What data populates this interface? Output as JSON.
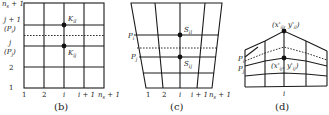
{
  "figure": {
    "panels": [
      {
        "id": "b",
        "caption": "(b)",
        "type": "rectangular-grid",
        "row_labels": [
          "n_s + 1",
          "j + 1",
          "(P_i)",
          "j",
          "(P_j)",
          "2",
          "1"
        ],
        "col_labels": [
          "1",
          "2",
          "i",
          "i + 1",
          "n_s + 1"
        ],
        "points": [
          {
            "label": "K_il",
            "position": "upper"
          },
          {
            "label": "K_ij",
            "position": "lower"
          }
        ]
      },
      {
        "id": "c",
        "caption": "(c)",
        "type": "trapezoidal-grid",
        "row_labels": [
          "P_i",
          "P_j"
        ],
        "col_labels": [
          "1",
          "2",
          "i",
          "i + 1",
          "n_s + 1"
        ],
        "points": [
          {
            "label": "S_il",
            "position": "upper"
          },
          {
            "label": "S_ij",
            "position": "lower"
          }
        ]
      },
      {
        "id": "d",
        "caption": "(d)",
        "type": "deformed-grid",
        "row_labels": [
          "P_i",
          "P_j"
        ],
        "col_labels": [
          "i"
        ],
        "points": [
          {
            "label": "(x'_il, y'_il)",
            "position": "upper"
          },
          {
            "label": "(x'_ij, y'_ij)",
            "position": "lower"
          }
        ]
      }
    ]
  },
  "text": {
    "b_ns1_top": "n",
    "b_ns1_top_sub": "s",
    "b_ns1_top_rest": " + 1",
    "b_j1": "j + 1",
    "b_pi": "(P",
    "b_pi_sub": "i",
    "b_pi_close": ")",
    "b_j": "j",
    "b_pj": "(P",
    "b_pj_sub": "j",
    "b_pj_close": ")",
    "b_2": "2",
    "b_1": "1",
    "b_col1": "1",
    "b_col2": "2",
    "b_coli": "i",
    "b_coli1": "i + 1",
    "b_colns": "n",
    "b_colns_sub": "s",
    "b_colns_rest": " + 1",
    "b_K_upper": "K",
    "b_K_upper_sub": "il",
    "b_K_lower": "K",
    "b_K_lower_sub": "ij",
    "b_caption": "(b)",
    "c_Pi": "P",
    "c_Pi_sub": "i",
    "c_Pj": "P",
    "c_Pj_sub": "j",
    "c_col1": "1",
    "c_col2": "2",
    "c_coli": "i",
    "c_coli1": "i + 1",
    "c_colns": "n",
    "c_colns_sub": "s",
    "c_colns_rest": " + 1",
    "c_S_upper": "S",
    "c_S_upper_sub": "il",
    "c_S_lower": "S",
    "c_S_lower_sub": "ij",
    "c_caption": "(c)",
    "d_Pi": "P",
    "d_Pi_sub": "i",
    "d_Pj": "P",
    "d_Pj_sub": "j",
    "d_coli": "i",
    "d_upper": "(x'",
    "d_upper_sub1": "il",
    "d_upper_mid": ", y'",
    "d_upper_sub2": "il",
    "d_upper_close": ")",
    "d_lower": "(x'",
    "d_lower_sub1": "ij",
    "d_lower_mid": ", y'",
    "d_lower_sub2": "ij",
    "d_lower_close": ")",
    "d_caption": "(d)"
  }
}
